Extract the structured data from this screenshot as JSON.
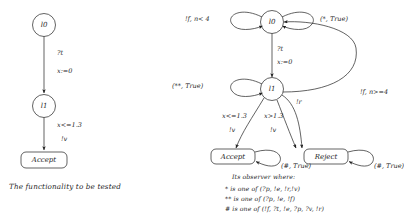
{
  "figure": {
    "left_diagram": {
      "title": "spec-automaton",
      "nodes": [
        {
          "id": "l0",
          "label": "l0",
          "shape": "circle"
        },
        {
          "id": "l1",
          "label": "l1",
          "shape": "circle"
        },
        {
          "id": "accept",
          "label": "Accept",
          "shape": "rounded-box"
        }
      ],
      "edges": [
        {
          "from": "l0",
          "to": "l1",
          "guard": "?t",
          "action": "x:=0"
        },
        {
          "from": "l1",
          "to": "accept",
          "guard": "x<=1.3",
          "action": "!v"
        }
      ],
      "caption": "The functionality to be tested"
    },
    "right_diagram": {
      "title": "observer-automaton",
      "nodes": [
        {
          "id": "l0",
          "label": "l0",
          "shape": "circle"
        },
        {
          "id": "l1",
          "label": "l1",
          "shape": "circle"
        },
        {
          "id": "accept",
          "label": "Accept",
          "shape": "rounded-box"
        },
        {
          "id": "reject",
          "label": "Reject",
          "shape": "rounded-box"
        }
      ],
      "edges": [
        {
          "from": "l0",
          "to": "l0",
          "label": "!f, n< 4",
          "kind": "self-loop-left"
        },
        {
          "from": "l0",
          "to": "l0",
          "label": "(*, True)",
          "kind": "self-loop-right"
        },
        {
          "from": "l0",
          "to": "l1",
          "guard": "?t",
          "action": "x:=0"
        },
        {
          "from": "l1",
          "to": "l1",
          "label": "(**, True)",
          "kind": "self-loop-left"
        },
        {
          "from": "l1",
          "to": "accept",
          "guard": "x<=1.3",
          "action": "!v"
        },
        {
          "from": "l1",
          "to": "reject",
          "guard": "x>1.3",
          "action": "!v"
        },
        {
          "from": "l1",
          "to": "reject",
          "label": "!r",
          "kind": "curve"
        },
        {
          "from": "l1",
          "to": "l0",
          "label": "!f, n>=4",
          "kind": "long-curve-right"
        },
        {
          "from": "accept",
          "to": "accept",
          "label": "(#, True)",
          "kind": "self-loop-right"
        },
        {
          "from": "reject",
          "to": "reject",
          "label": "(#, True)",
          "kind": "self-loop-right"
        }
      ],
      "caption": "Its observer where:",
      "legend": [
        "* is one of (?p, !e, !r,!v)",
        "** is one of (?p, !e, !f)",
        "# is one of (!f, ?t, !e, ?p, ?v, !r)"
      ]
    }
  }
}
